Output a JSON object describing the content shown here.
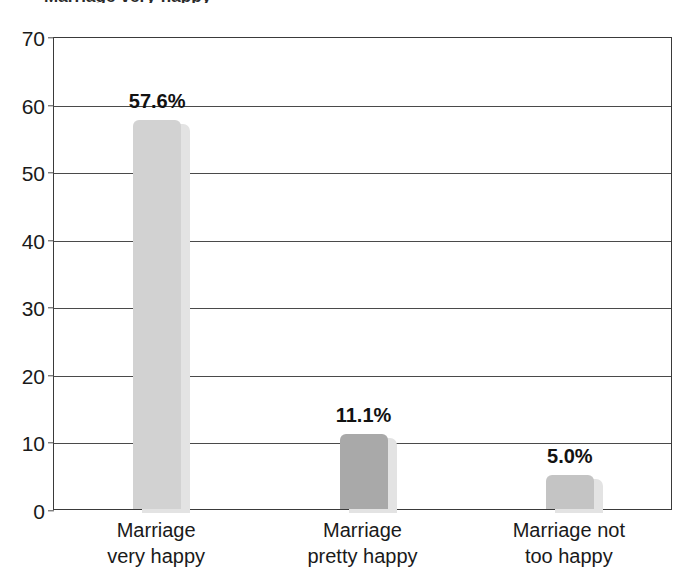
{
  "chart_data": {
    "type": "bar",
    "title": "Marriage very happy",
    "title_clipped": true,
    "subtitle": "",
    "xlabel": "",
    "ylabel": "",
    "categories": [
      "Marriage\nvery happy",
      "Marriage\npretty happy",
      "Marriage not\ntoo happy"
    ],
    "category_lines": [
      [
        "Marriage",
        "very happy"
      ],
      [
        "Marriage",
        "pretty happy"
      ],
      [
        "Marriage not",
        "too happy"
      ]
    ],
    "values": [
      57.6,
      11.1,
      5.0
    ],
    "value_labels": [
      "57.6%",
      "11.1%",
      "5.0%"
    ],
    "ylim": [
      0,
      70
    ],
    "ytick_values": [
      0,
      10,
      20,
      30,
      40,
      50,
      60,
      70
    ],
    "ytick_labels": [
      "0",
      "10",
      "20",
      "30",
      "40",
      "50",
      "60",
      "70"
    ],
    "grid": true,
    "grid_axis": "y",
    "legend": false,
    "legend_position": "none",
    "bar_colors": [
      "#d2d2d2",
      "#a9a9a9",
      "#c4c4c4"
    ],
    "shadow_color": "#e3e3e3",
    "axis_color": "#3a3a3a",
    "grid_color": "#4a4a4a",
    "background": "#ffffff"
  }
}
